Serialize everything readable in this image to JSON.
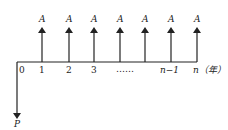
{
  "diagram": {
    "type": "cash-flow-diagram",
    "inflow_label": "A",
    "outflow_label": "P",
    "ticks": [
      {
        "label": "0",
        "x": 17
      },
      {
        "label": "1",
        "x": 42
      },
      {
        "label": "2",
        "x": 69
      },
      {
        "label": "3",
        "x": 94
      },
      {
        "label": "……",
        "x": 133
      },
      {
        "label": "n−1",
        "x": 171
      },
      {
        "label": "n（年）",
        "x": 197
      }
    ],
    "inflow_arrows_x": [
      42,
      69,
      94,
      120,
      145,
      171,
      197
    ],
    "colors": {
      "line": "#222222",
      "background": "#ffffff"
    }
  }
}
